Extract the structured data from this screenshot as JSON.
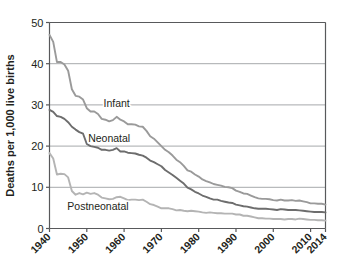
{
  "chart_data": {
    "type": "line",
    "title": "",
    "xlabel": "",
    "ylabel": "Deaths per 1,000 live births",
    "xlim": [
      1940,
      2014
    ],
    "ylim": [
      0,
      50
    ],
    "grid": "horizontal",
    "legend_position": "inline-labels",
    "y_ticks": [
      "0",
      "10",
      "20",
      "30",
      "40",
      "50"
    ],
    "y_tick_values": [
      0,
      10,
      20,
      30,
      40,
      50
    ],
    "x_ticks": [
      "1940",
      "1950",
      "1960",
      "1970",
      "1980",
      "1990",
      "2000",
      "2010",
      "2014"
    ],
    "x_tick_values": [
      1940,
      1950,
      1960,
      1970,
      1980,
      1990,
      2000,
      2010,
      2014
    ],
    "x": [
      1940,
      1941,
      1942,
      1943,
      1944,
      1945,
      1946,
      1947,
      1948,
      1949,
      1950,
      1951,
      1952,
      1953,
      1954,
      1955,
      1956,
      1957,
      1958,
      1959,
      1960,
      1961,
      1962,
      1963,
      1964,
      1965,
      1966,
      1967,
      1968,
      1969,
      1970,
      1971,
      1972,
      1973,
      1974,
      1975,
      1976,
      1977,
      1978,
      1979,
      1980,
      1981,
      1982,
      1983,
      1984,
      1985,
      1986,
      1987,
      1988,
      1989,
      1990,
      1991,
      1992,
      1993,
      1994,
      1995,
      1996,
      1997,
      1998,
      1999,
      2000,
      2001,
      2002,
      2003,
      2004,
      2005,
      2006,
      2007,
      2008,
      2009,
      2010,
      2011,
      2012,
      2013,
      2014
    ],
    "series": [
      {
        "name": "Infant",
        "color": "#9a9a9a",
        "label_x": 1958,
        "label_y": 29.5,
        "values": [
          47.0,
          45.3,
          40.4,
          40.4,
          39.8,
          38.3,
          33.8,
          32.2,
          32.0,
          31.3,
          29.2,
          28.4,
          28.4,
          27.8,
          26.6,
          26.4,
          26.0,
          26.3,
          27.1,
          26.4,
          26.0,
          25.3,
          25.3,
          25.2,
          24.8,
          24.7,
          23.7,
          22.4,
          21.8,
          20.9,
          20.0,
          19.1,
          18.5,
          17.7,
          16.7,
          16.1,
          15.2,
          14.1,
          13.8,
          13.1,
          12.6,
          11.9,
          11.5,
          11.2,
          10.8,
          10.6,
          10.4,
          10.1,
          10.0,
          9.8,
          9.2,
          8.9,
          8.5,
          8.4,
          8.0,
          7.6,
          7.3,
          7.2,
          7.2,
          7.1,
          6.9,
          6.8,
          7.0,
          6.8,
          6.8,
          6.9,
          6.7,
          6.8,
          6.6,
          6.4,
          6.1,
          6.1,
          6.0,
          6.0,
          5.8
        ]
      },
      {
        "name": "Neonatal",
        "color": "#6d6d6d",
        "label_x": 1956,
        "label_y": 21.0,
        "values": [
          28.8,
          28.3,
          27.3,
          27.1,
          26.6,
          25.8,
          24.7,
          24.0,
          23.4,
          23.0,
          20.5,
          20.0,
          19.8,
          19.6,
          19.1,
          19.1,
          18.9,
          19.1,
          19.5,
          18.7,
          18.7,
          18.4,
          18.3,
          18.2,
          17.9,
          17.7,
          17.2,
          16.5,
          16.1,
          15.6,
          15.1,
          14.2,
          13.6,
          13.0,
          12.3,
          11.6,
          10.9,
          9.9,
          9.5,
          8.9,
          8.5,
          8.0,
          7.7,
          7.3,
          7.0,
          7.0,
          6.7,
          6.5,
          6.3,
          6.2,
          5.8,
          5.6,
          5.4,
          5.3,
          5.1,
          4.9,
          4.8,
          4.8,
          4.8,
          4.7,
          4.6,
          4.5,
          4.7,
          4.6,
          4.5,
          4.5,
          4.5,
          4.4,
          4.3,
          4.2,
          4.1,
          4.0,
          4.0,
          4.0,
          3.9
        ]
      },
      {
        "name": "Postneonatal",
        "color": "#b4b4b4",
        "label_x": 1953,
        "label_y": 4.4,
        "values": [
          18.3,
          17.0,
          13.1,
          13.3,
          13.2,
          12.4,
          9.1,
          8.2,
          8.6,
          8.3,
          8.7,
          8.4,
          8.6,
          8.2,
          7.5,
          7.3,
          7.1,
          7.2,
          7.6,
          7.7,
          7.3,
          6.9,
          7.0,
          7.0,
          6.9,
          7.0,
          6.5,
          5.9,
          5.7,
          5.3,
          4.9,
          4.9,
          4.9,
          4.7,
          4.4,
          4.5,
          4.3,
          4.2,
          4.3,
          4.2,
          4.1,
          3.9,
          3.8,
          3.9,
          3.8,
          3.7,
          3.7,
          3.6,
          3.6,
          3.6,
          3.4,
          3.4,
          3.1,
          3.1,
          2.9,
          2.7,
          2.5,
          2.5,
          2.4,
          2.4,
          2.3,
          2.3,
          2.3,
          2.2,
          2.3,
          2.3,
          2.2,
          2.4,
          2.3,
          2.2,
          2.1,
          2.1,
          2.0,
          2.0,
          1.9
        ]
      }
    ]
  },
  "axes": {
    "y_axis_title": "Deaths per 1,000 live births"
  },
  "colors": {
    "frame": "#58595b",
    "gridline": "#a7a9ac",
    "text": "#231f20",
    "background": "#ffffff"
  }
}
